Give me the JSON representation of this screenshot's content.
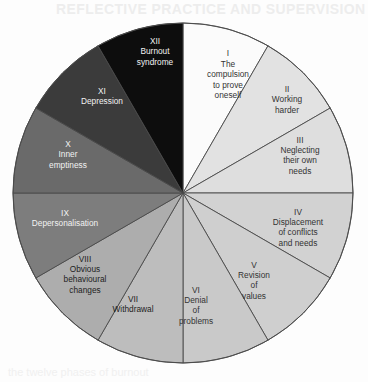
{
  "page": {
    "bleed_through_header": "REFLECTIVE PRACTICE AND SUPERVISION",
    "bleed_through_footer": "the twelve phases of burnout"
  },
  "chart_data": {
    "type": "pie",
    "title": "",
    "legend_position": "in-slice",
    "grid": false,
    "center": {
      "x": 183,
      "y": 193
    },
    "radius": 170,
    "start_angle_deg": 0,
    "equal_slices": true,
    "slice_count": 12,
    "categories": [
      "The compulsion to prove oneself",
      "Working harder",
      "Neglecting their own needs",
      "Displacement of conflicts and needs",
      "Revision of values",
      "Denial of problems",
      "Withdrawal",
      "Obvious behavioural changes",
      "Depersonalisation",
      "Inner emptiness",
      "Depression",
      "Burnout syndrome"
    ],
    "values": [
      30,
      30,
      30,
      30,
      30,
      30,
      30,
      30,
      30,
      30,
      30,
      30
    ],
    "slices": [
      {
        "roman": "I",
        "lines": [
          "The",
          "compulsion",
          "to prove",
          "oneself"
        ],
        "fill": "#fbfbfb",
        "text_color": "#333333",
        "start_deg": 0,
        "end_deg": 30,
        "label_x": 228,
        "label_y": 75
      },
      {
        "roman": "II",
        "lines": [
          "Working",
          "harder"
        ],
        "fill": "#e2e2e2",
        "text_color": "#333333",
        "start_deg": 30,
        "end_deg": 60,
        "label_x": 287,
        "label_y": 100
      },
      {
        "roman": "III",
        "lines": [
          "Neglecting",
          "their own",
          "needs"
        ],
        "fill": "#dedede",
        "text_color": "#333333",
        "start_deg": 60,
        "end_deg": 90,
        "label_x": 300,
        "label_y": 156
      },
      {
        "roman": "IV",
        "lines": [
          "Displacement",
          "of conflicts",
          "and needs"
        ],
        "fill": "#d2d2d2",
        "text_color": "#333333",
        "start_deg": 90,
        "end_deg": 120,
        "label_x": 298,
        "label_y": 228
      },
      {
        "roman": "V",
        "lines": [
          "Revision",
          "of",
          "values"
        ],
        "fill": "#cfcfcf",
        "text_color": "#333333",
        "start_deg": 120,
        "end_deg": 150,
        "label_x": 254,
        "label_y": 281
      },
      {
        "roman": "VI",
        "lines": [
          "Denial",
          "of",
          "problems"
        ],
        "fill": "#c9c9c9",
        "text_color": "#333333",
        "start_deg": 150,
        "end_deg": 180,
        "label_x": 196,
        "label_y": 306
      },
      {
        "roman": "VII",
        "lines": [
          "Withdrawal"
        ],
        "fill": "#bdbdbd",
        "text_color": "#1e1e1e",
        "start_deg": 180,
        "end_deg": 210,
        "label_x": 133,
        "label_y": 305
      },
      {
        "roman": "VIII",
        "lines": [
          "Obvious",
          "behavioural",
          "changes"
        ],
        "fill": "#adadad",
        "text_color": "#1e1e1e",
        "start_deg": 210,
        "end_deg": 240,
        "label_x": 85,
        "label_y": 275
      },
      {
        "roman": "IX",
        "lines": [
          "Depersonalisation"
        ],
        "fill": "#7d7d7d",
        "text_color": "#f2f2f2",
        "start_deg": 240,
        "end_deg": 270,
        "label_x": 65,
        "label_y": 219
      },
      {
        "roman": "X",
        "lines": [
          "Inner",
          "emptiness"
        ],
        "fill": "#6a6a6a",
        "text_color": "#f2f2f2",
        "start_deg": 270,
        "end_deg": 300,
        "label_x": 68,
        "label_y": 155
      },
      {
        "roman": "XI",
        "lines": [
          "Depression"
        ],
        "fill": "#3b3b3b",
        "text_color": "#f2f2f2",
        "start_deg": 300,
        "end_deg": 330,
        "label_x": 102,
        "label_y": 97
      },
      {
        "roman": "XII",
        "lines": [
          "Burnout",
          "syndrome"
        ],
        "fill": "#0d0d0d",
        "text_color": "#f2f2f2",
        "start_deg": 330,
        "end_deg": 360,
        "label_x": 155,
        "label_y": 52
      }
    ],
    "stroke_color": "#4a4a4a",
    "stroke_width": 0.9
  }
}
